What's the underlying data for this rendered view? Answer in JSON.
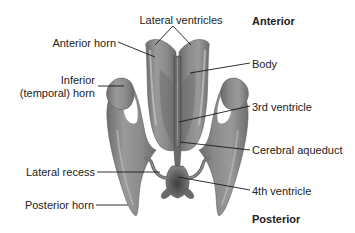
{
  "diagram": {
    "orientation": {
      "top": "Anterior",
      "bottom": "Posterior"
    },
    "labels": {
      "lateral_ventricles": "Lateral ventricles",
      "anterior_horn": "Anterior horn",
      "inferior_horn_line1": "Inferior",
      "inferior_horn_line2": "(temporal) horn",
      "body": "Body",
      "third_ventricle": "3rd ventricle",
      "cerebral_aqueduct": "Cerebral aqueduct",
      "lateral_recess": "Lateral recess",
      "fourth_ventricle": "4th ventricle",
      "posterior_horn": "Posterior horn"
    },
    "colors": {
      "ventricle_fill": "#8a8a8a",
      "ventricle_dark": "#555555",
      "ventricle_light": "#b5b5b5",
      "leader_line": "#1a1a1a",
      "background": "#ffffff"
    }
  }
}
